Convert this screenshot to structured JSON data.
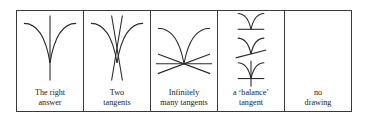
{
  "figure": {
    "stroke_color": "#2a2a2a",
    "border_color": "#3a3a3a",
    "panels": [
      {
        "id": "right-answer",
        "label_line1": "The right",
        "label_line2": "answer",
        "drawing": "cusp-with-vertical-tangent"
      },
      {
        "id": "two-tangents",
        "label_line1": "Two",
        "label_line2": "tangents",
        "drawing": "cusp-with-two-crossing-lines"
      },
      {
        "id": "infinitely-many",
        "label_line1": "Infinitely",
        "label_line2": "many tangents",
        "drawing": "cusp-with-fan-of-lines"
      },
      {
        "id": "balance-tangent",
        "label_line1": "a ‘balance’",
        "label_line2": "tangent",
        "drawing": "three-cusps-with-horizontal-or-tilted-lines"
      },
      {
        "id": "no-drawing",
        "label_line1": "no",
        "label_line2": "drawing",
        "drawing": "none"
      }
    ]
  }
}
